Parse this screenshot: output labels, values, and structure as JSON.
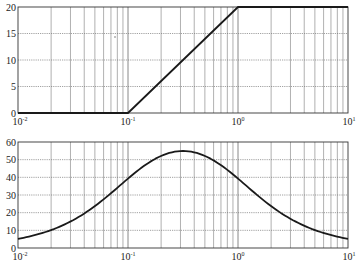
{
  "chart_data": [
    {
      "type": "line",
      "title": "",
      "xlabel": "",
      "ylabel": "",
      "xscale": "log",
      "xlim": [
        0.01,
        10
      ],
      "ylim": [
        0,
        20
      ],
      "grid": true,
      "xticks": [
        "10^-2",
        "10^-1",
        "10^0",
        "10^1"
      ],
      "yticks": [
        0,
        5,
        10,
        15,
        20
      ],
      "series": [
        {
          "name": "magnitude asymptote",
          "x": [
            0.01,
            0.1,
            1,
            10
          ],
          "y": [
            0,
            0,
            20,
            20
          ]
        }
      ]
    },
    {
      "type": "line",
      "title": "",
      "xlabel": "",
      "ylabel": "",
      "xscale": "log",
      "xlim": [
        0.01,
        10
      ],
      "ylim": [
        0,
        60
      ],
      "grid": true,
      "xticks": [
        "10^-2",
        "10^-1",
        "10^0",
        "10^1"
      ],
      "yticks": [
        0,
        10,
        20,
        30,
        40,
        50,
        60
      ],
      "series": [
        {
          "name": "phase",
          "x": [
            0.01,
            0.02,
            0.03,
            0.05,
            0.1,
            0.2,
            0.316,
            0.5,
            1,
            2,
            3,
            5,
            10
          ],
          "y": [
            5.1,
            10.2,
            15.0,
            23.7,
            39.3,
            52.1,
            54.9,
            51.7,
            39.3,
            21.8,
            15.0,
            9.9,
            5.1
          ]
        }
      ]
    }
  ],
  "axes": {
    "top": {
      "yticks": [
        "0",
        "5",
        "10",
        "15",
        "20"
      ],
      "xticks": [
        {
          "base": "10",
          "exp": "-2"
        },
        {
          "base": "10",
          "exp": "-1"
        },
        {
          "base": "10",
          "exp": "0"
        },
        {
          "base": "10",
          "exp": "1"
        }
      ]
    },
    "bottom": {
      "yticks": [
        "0",
        "10",
        "20",
        "30",
        "40",
        "50",
        "60"
      ],
      "xticks": [
        {
          "base": "10",
          "exp": "-2"
        },
        {
          "base": "10",
          "exp": "-1"
        },
        {
          "base": "10",
          "exp": "0"
        },
        {
          "base": "10",
          "exp": "1"
        }
      ]
    }
  },
  "colors": {
    "line": "#1a1a1a",
    "grid": "#7a7a7a",
    "frame": "#333333"
  }
}
